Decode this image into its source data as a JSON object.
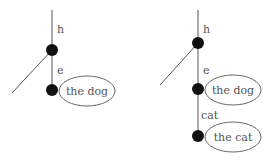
{
  "colors": {
    "line": "#555555",
    "node": "#111111",
    "ellipse": "#666666",
    "text": "#555555"
  },
  "left_tree": {
    "edge_top_label": "h",
    "edge_mid_label": "e",
    "ellipse_label": "the dog"
  },
  "right_tree": {
    "edge_top_label": "h",
    "edge_mid_label": "e",
    "ellipse1_label": "the dog",
    "edge_bottom_label": "cat",
    "ellipse2_label": "the cat"
  }
}
